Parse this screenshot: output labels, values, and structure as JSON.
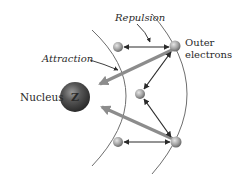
{
  "diagram": {
    "labels": {
      "repulsion": "Repulsion",
      "attraction": "Attraction",
      "nucleus": "Nucleus",
      "nucleus_symbol": "Z",
      "outer_line1": "Outer",
      "outer_line2": "electrons"
    },
    "colors": {
      "arc": "#6e6e6e",
      "repulsion_arrow": "#2a2a2a",
      "attraction_arrow": "#8c8c8c",
      "electron": "#a8a8a8",
      "nucleus": "#4a4a4a"
    },
    "electrons": [
      {
        "id": "e1",
        "x": 118,
        "y": 47
      },
      {
        "id": "e2",
        "x": 175,
        "y": 46
      },
      {
        "id": "e3",
        "x": 140,
        "y": 94
      },
      {
        "id": "e4",
        "x": 118,
        "y": 142
      },
      {
        "id": "e5",
        "x": 176,
        "y": 142
      }
    ]
  }
}
